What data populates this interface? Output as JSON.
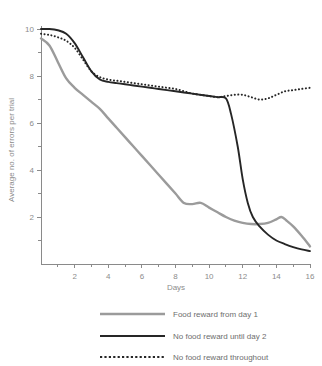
{
  "chart_data": {
    "type": "line",
    "title": "",
    "xlabel": "Days",
    "ylabel": "Average no. of errors per trial",
    "xlim": [
      0,
      16
    ],
    "ylim": [
      0,
      10.3
    ],
    "xticks": [
      1,
      2,
      3,
      4,
      5,
      6,
      7,
      8,
      9,
      10,
      11,
      12,
      13,
      14,
      15,
      16
    ],
    "xtick_labels": [
      "",
      "2",
      "",
      "4",
      "",
      "6",
      "",
      "8",
      "",
      "10",
      "",
      "12",
      "",
      "14",
      "",
      "16"
    ],
    "yticks": [
      1,
      2,
      3,
      4,
      5,
      6,
      7,
      8,
      9,
      10
    ],
    "ytick_labels": [
      "",
      "2",
      "",
      "4",
      "",
      "6",
      "",
      "8",
      "",
      "10"
    ],
    "grid": false,
    "legend_position": "bottom",
    "series": [
      {
        "name": "Food reward from day 1",
        "color": "#9b9b9b",
        "style": "solid",
        "x": [
          0,
          0.5,
          1,
          1.5,
          2,
          2.5,
          3,
          3.5,
          4,
          4.5,
          5,
          5.5,
          6,
          6.5,
          7,
          7.5,
          8,
          8.5,
          9,
          9.5,
          10,
          10.5,
          11,
          11.5,
          12,
          12.5,
          13,
          13.5,
          14,
          14.3,
          14.6,
          15,
          15.5,
          16
        ],
        "y": [
          9.6,
          9.3,
          8.6,
          7.9,
          7.5,
          7.2,
          6.9,
          6.6,
          6.2,
          5.8,
          5.4,
          5.0,
          4.6,
          4.2,
          3.8,
          3.4,
          3.0,
          2.6,
          2.55,
          2.6,
          2.4,
          2.2,
          2.0,
          1.85,
          1.75,
          1.7,
          1.7,
          1.75,
          1.9,
          2.0,
          1.85,
          1.6,
          1.2,
          0.75
        ]
      },
      {
        "name": "No food reward until day 2",
        "color": "#262626",
        "style": "solid",
        "x": [
          0,
          0.5,
          1,
          1.5,
          2,
          2.5,
          3,
          3.5,
          4,
          4.5,
          5,
          5.5,
          6,
          6.5,
          7,
          7.5,
          8,
          8.5,
          9,
          9.5,
          10,
          10.5,
          11,
          11.3,
          11.7,
          12,
          12.3,
          12.6,
          13,
          13.5,
          14,
          14.5,
          15,
          15.5,
          16
        ],
        "y": [
          10.0,
          10.0,
          9.95,
          9.8,
          9.4,
          8.8,
          8.2,
          7.85,
          7.75,
          7.7,
          7.65,
          7.6,
          7.55,
          7.5,
          7.45,
          7.4,
          7.35,
          7.3,
          7.25,
          7.2,
          7.15,
          7.1,
          7.05,
          6.4,
          5.0,
          3.6,
          2.6,
          2.0,
          1.6,
          1.25,
          1.0,
          0.85,
          0.72,
          0.62,
          0.55
        ]
      },
      {
        "name": "No food reward throughout",
        "color": "#262626",
        "style": "dotted",
        "x": [
          0,
          0.5,
          1,
          1.5,
          2,
          2.5,
          3,
          3.5,
          4,
          4.5,
          5,
          5.5,
          6,
          6.5,
          7,
          7.5,
          8,
          8.5,
          9,
          9.5,
          10,
          10.5,
          11,
          11.5,
          12,
          12.5,
          13,
          13.5,
          14,
          14.5,
          15,
          15.5,
          16
        ],
        "y": [
          9.8,
          9.75,
          9.65,
          9.5,
          9.2,
          8.7,
          8.2,
          7.95,
          7.85,
          7.8,
          7.75,
          7.7,
          7.65,
          7.6,
          7.55,
          7.5,
          7.45,
          7.35,
          7.25,
          7.2,
          7.15,
          7.1,
          7.15,
          7.2,
          7.2,
          7.1,
          7.0,
          7.05,
          7.2,
          7.35,
          7.4,
          7.45,
          7.5
        ]
      }
    ]
  },
  "legend": {
    "items": [
      {
        "label": "Food reward from day 1"
      },
      {
        "label": "No food reward until day 2"
      },
      {
        "label": "No food reward throughout"
      }
    ]
  }
}
